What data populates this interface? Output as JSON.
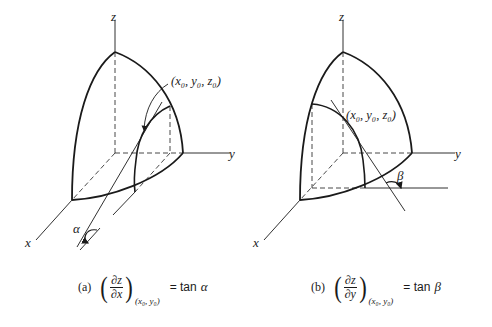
{
  "figure": {
    "panels": [
      {
        "id": "a",
        "axes": {
          "x": "x",
          "y": "y",
          "z": "z"
        },
        "point_label": "(x₀, y₀, z₀)",
        "angle_label": "α",
        "caption": {
          "tag": "(a)",
          "numerator": "∂z",
          "denominator": "∂x",
          "subscript": "(x₀, y₀)",
          "rhs_text": "= tan",
          "rhs_symbol": "α"
        }
      },
      {
        "id": "b",
        "axes": {
          "x": "x",
          "y": "y",
          "z": "z"
        },
        "point_label": "(x₀, y₀, z₀)",
        "angle_label": "β",
        "caption": {
          "tag": "(b)",
          "numerator": "∂z",
          "denominator": "∂y",
          "subscript": "(x₀, y₀)",
          "rhs_text": "= tan",
          "rhs_symbol": "β"
        }
      }
    ],
    "colors": {
      "ink": "#1a1a1a",
      "background": "#ffffff"
    }
  }
}
